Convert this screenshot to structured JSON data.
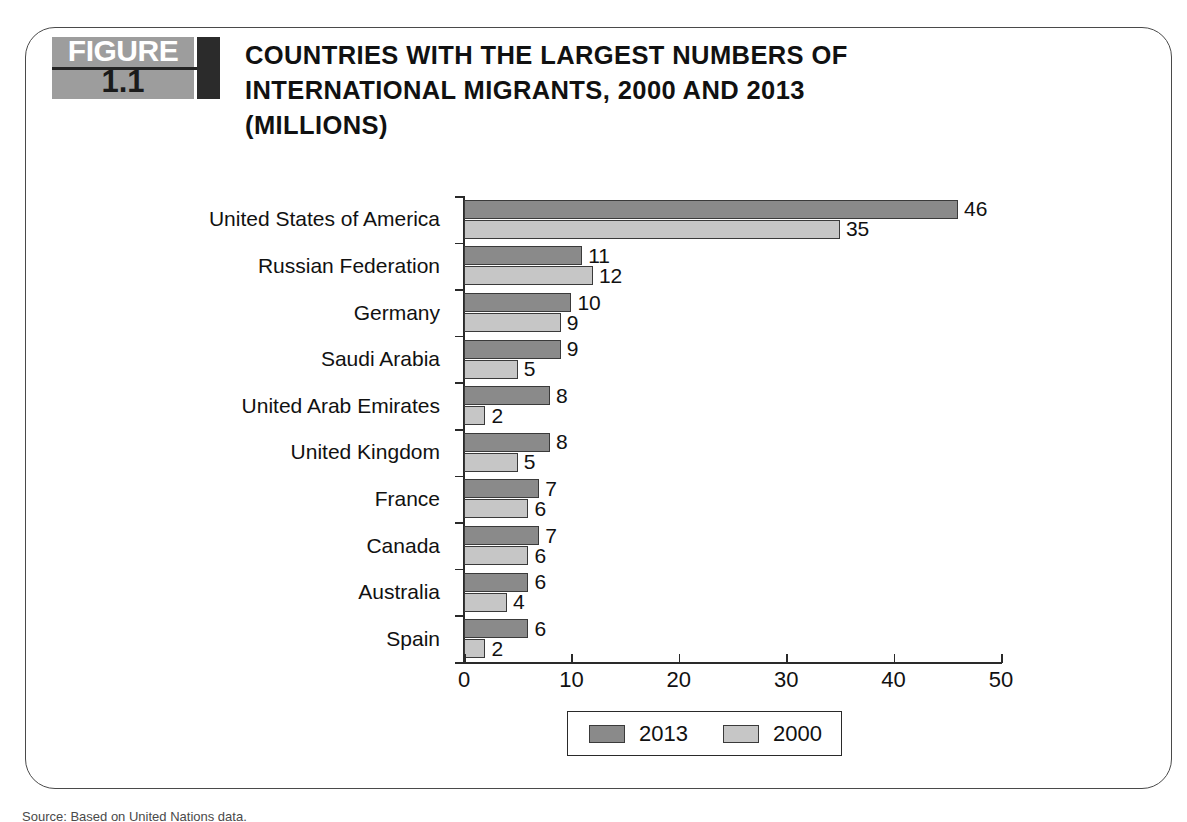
{
  "figure": {
    "badge_word": "FIGURE",
    "badge_number": "1.1",
    "title_line1": "COUNTRIES WITH THE LARGEST NUMBERS OF",
    "title_line2": "INTERNATIONAL MIGRANTS, 2000 AND 2013",
    "title_line3": "(MILLIONS)",
    "source_note": "Source: Based on United Nations data."
  },
  "colors": {
    "series_2013": "#8a8a8a",
    "series_2000": "#c6c6c6",
    "badge_gray": "#9d9d9d",
    "badge_dark": "#2b2b2b",
    "axis": "#2a2a2a",
    "frame": "#4a4a4a"
  },
  "chart_data": {
    "type": "bar",
    "orientation": "horizontal",
    "title": "COUNTRIES WITH THE LARGEST NUMBERS OF INTERNATIONAL MIGRANTS, 2000 AND 2013 (MILLIONS)",
    "xlabel": "",
    "ylabel": "",
    "xlim": [
      0,
      50
    ],
    "xticks": [
      "0",
      "10",
      "20",
      "30",
      "40",
      "50"
    ],
    "grid": false,
    "legend_position": "bottom",
    "categories": [
      "United States of America",
      "Russian Federation",
      "Germany",
      "Saudi Arabia",
      "United Arab Emirates",
      "United Kingdom",
      "France",
      "Canada",
      "Australia",
      "Spain"
    ],
    "series": [
      {
        "name": "2013",
        "values": [
          46,
          11,
          10,
          9,
          8,
          8,
          7,
          7,
          6,
          6
        ],
        "labels": [
          "46",
          "11",
          "10",
          "9",
          "8",
          "8",
          "7",
          "7",
          "6",
          "6"
        ]
      },
      {
        "name": "2000",
        "values": [
          35,
          12,
          9,
          5,
          2,
          5,
          6,
          6,
          4,
          2
        ],
        "labels": [
          "35",
          "12",
          "9",
          "5",
          "2",
          "5",
          "6",
          "6",
          "4",
          "2"
        ]
      }
    ]
  }
}
